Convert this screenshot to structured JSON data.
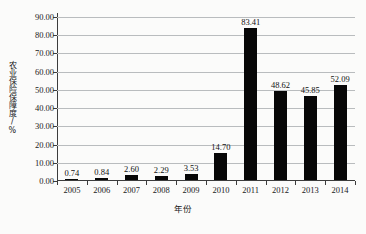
{
  "chart_data": {
    "type": "bar",
    "title": "",
    "xlabel": "年份",
    "ylabel": "农业保险保障度/%",
    "categories": [
      "2005",
      "2006",
      "2007",
      "2008",
      "2009",
      "2010",
      "2011",
      "2012",
      "2013",
      "2014"
    ],
    "values": [
      0.74,
      0.84,
      2.6,
      2.29,
      3.53,
      14.7,
      83.41,
      48.62,
      45.85,
      52.09
    ],
    "value_labels": [
      "0.74",
      "0.84",
      "2.60",
      "2.29",
      "3.53",
      "14.70",
      "83.41",
      "48.62",
      "45.85",
      "52.09"
    ],
    "ylim": [
      0,
      90
    ],
    "yticks": [
      0,
      10,
      20,
      30,
      40,
      50,
      60,
      70,
      80,
      90
    ],
    "ytick_labels": [
      "0.00",
      "10.00",
      "20.00",
      "30.00",
      "40.00",
      "50.00",
      "60.00",
      "70.00",
      "80.00",
      "90.00"
    ],
    "grid": true,
    "legend": "none",
    "series_color": "#070707",
    "gridline_color": "#b9bcbe",
    "axis_color": "#3c3c3c"
  }
}
